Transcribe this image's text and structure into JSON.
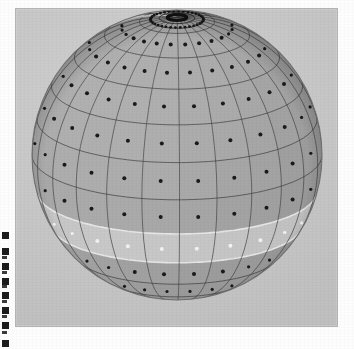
{
  "figure": {
    "kind": "shaded-sphere-grid-diagram",
    "caption": "",
    "background_color": "#ffffff",
    "plate_color": "#c9c9c9",
    "frame_border_color": "#b4b4b4"
  },
  "globe": {
    "name": "Sphere with latitude-longitude grid cells",
    "center_x": 161,
    "center_y": 146,
    "radius": 145,
    "tilt_deg": 18,
    "rotation_deg": -14,
    "meridian_count": 24,
    "parallel_count": 12,
    "cell_dot_label": "cell-center-node",
    "colors": {
      "base_dark": "#8e8e8e",
      "base_mid": "#9d9d9d",
      "base_light": "#b0b0b0",
      "highlight_stripe": "#d9d9d9",
      "light_band": "#bdbdbd",
      "grid_dark": "#3c3c3c",
      "grid_light": "#e8e8e8",
      "dot_dark": "#1a1a1a",
      "dot_light": "#f2f2f2",
      "limb_shadow": "#7c7c7c"
    },
    "highlight_stripe": {
      "label": "bright-meridian-stripe",
      "meridian_index_start": 15,
      "meridian_index_end": 17
    },
    "light_band": {
      "label": "bright-latitude-band",
      "parallel_index": 7,
      "latitude_deg_start": -8,
      "latitude_deg_end": -22
    },
    "pole": {
      "label": "north-pole-cap",
      "ring_count": 3,
      "dot_ring_label": "pole-dot-ring"
    }
  },
  "edge_marks": {
    "label": "scan-edge-artifacts",
    "positions_y": [
      232,
      248,
      263,
      278,
      292,
      307,
      322,
      340
    ],
    "thin_positions_y": [
      256,
      271,
      285,
      300,
      315,
      331
    ]
  }
}
